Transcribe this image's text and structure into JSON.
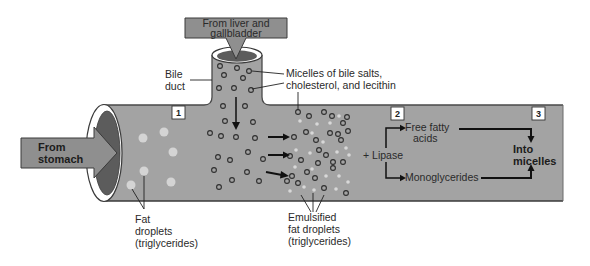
{
  "diagram": {
    "type": "digestion-of-fats",
    "inputs": {
      "liver_arrow": {
        "line1": "From liver and",
        "line2": "gallbladder"
      },
      "stomach_arrow": {
        "line1": "From",
        "line2": "stomach"
      }
    },
    "labels": {
      "bile_duct": {
        "line1": "Bile",
        "line2": "duct"
      },
      "micelles": {
        "line1": "Micelles of bile salts,",
        "line2": "cholesterol, and lecithin"
      },
      "fat_droplets": {
        "line1": "Fat",
        "line2": "droplets",
        "line3": "(triglycerides)"
      },
      "emulsified": {
        "line1": "Emulsified",
        "line2": "fat droplets",
        "line3": "(triglycerides)"
      },
      "lipase": "+ Lipase",
      "free_fatty_acids": {
        "line1": "Free fatty",
        "line2": "acids"
      },
      "monoglycerides": "Monoglycerides",
      "into_micelles": {
        "line1": "Into",
        "line2": "micelles"
      }
    },
    "steps": [
      {
        "number": "1"
      },
      {
        "number": "2"
      },
      {
        "number": "3"
      }
    ],
    "colors": {
      "tube": "#a3a3a3",
      "tube_edge": "#4a4a4a",
      "arrow_fill": "#8f8f8f",
      "opening_dark": "#5c5c5c",
      "droplet": "#d4d4d4",
      "micelle_stroke": "#2e2e2e"
    }
  }
}
